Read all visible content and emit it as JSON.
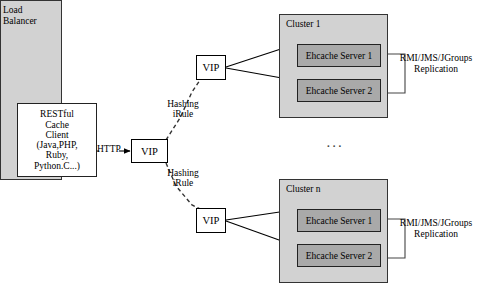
{
  "diagram": {
    "width": 485,
    "height": 301,
    "colors": {
      "background": "#ffffff",
      "container_fill": "#d2d2d2",
      "server_fill": "#a9a9a9",
      "box_fill": "#ffffff",
      "stroke": "#000000"
    }
  },
  "client": {
    "name": "RESTful Cache Client",
    "lines": [
      "RESTful",
      "Cache",
      "Client",
      "(Java,PHP,",
      "Ruby,",
      "Python.C...)"
    ]
  },
  "http_link": {
    "label": "HTTP"
  },
  "load_balancer": {
    "title_lines": [
      "Load",
      "Balancer"
    ],
    "hashing_rules": [
      {
        "id": "top",
        "lines": [
          "Hashing",
          "iRule"
        ]
      },
      {
        "id": "bottom",
        "lines": [
          "Hashing",
          "iRule"
        ]
      }
    ]
  },
  "vips": [
    {
      "id": "vip-client",
      "label": "VIP"
    },
    {
      "id": "vip-top",
      "label": "VIP"
    },
    {
      "id": "vip-bottom",
      "label": "VIP"
    }
  ],
  "clusters": [
    {
      "id": "cluster-1",
      "title": "Cluster 1",
      "servers": [
        {
          "label": "Ehcache Server 1"
        },
        {
          "label": "Ehcache Server 2"
        }
      ],
      "replication": {
        "lines": [
          "RMI/JMS/JGroups",
          "Replication"
        ]
      }
    },
    {
      "id": "cluster-n",
      "title": "Cluster n",
      "servers": [
        {
          "label": "Ehcache Server 1"
        },
        {
          "label": "Ehcache Server 2"
        }
      ],
      "replication": {
        "lines": [
          "RMI/JMS/JGroups",
          "Replication"
        ]
      }
    }
  ],
  "ellipsis": {
    "label": "..."
  }
}
